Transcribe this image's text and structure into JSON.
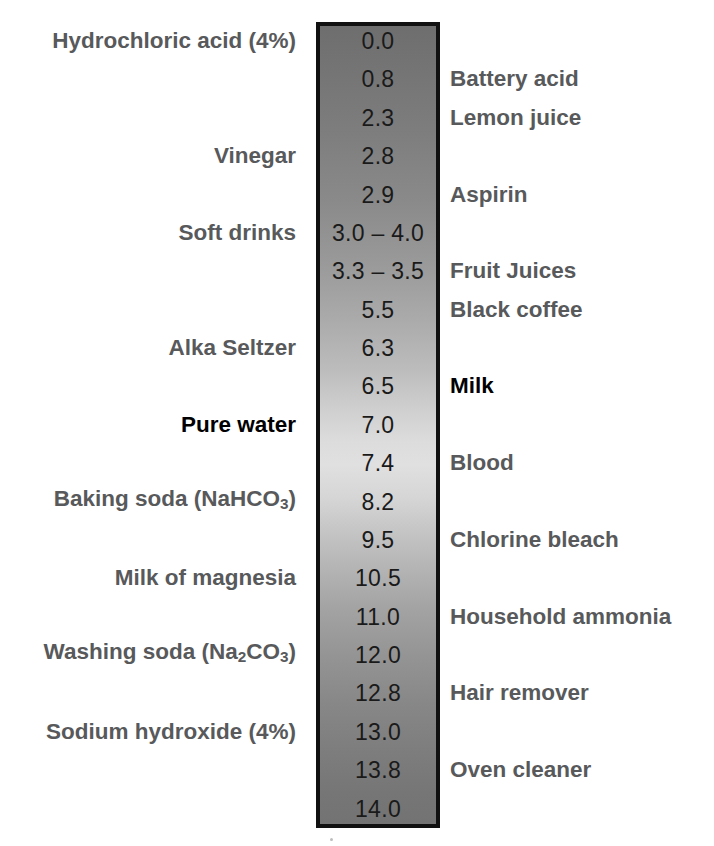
{
  "figure": {
    "column": {
      "top_color": "#6e6e6e",
      "mid_color": "#e0e0e0",
      "bottom_color": "#737373",
      "border_color": "#111111"
    },
    "label_color": "#58595b",
    "emphasis_color": "#000000",
    "value_color": "#1a1a1a"
  },
  "chart_data": {
    "type": "table",
    "xlabel": "",
    "ylabel": "pH",
    "ylim": [
      0.0,
      14.0
    ],
    "columns": [
      "Left substance",
      "pH value",
      "Right substance"
    ],
    "rows": [
      {
        "left": "Hydrochloric acid (4%)",
        "value": "0.0",
        "right": "",
        "ph": 0.0,
        "emphasis": false
      },
      {
        "left": "",
        "value": "0.8",
        "right": "Battery acid",
        "ph": 0.8,
        "emphasis": false
      },
      {
        "left": "",
        "value": "2.3",
        "right": "Lemon juice",
        "ph": 2.3,
        "emphasis": false
      },
      {
        "left": "Vinegar",
        "value": "2.8",
        "right": "",
        "ph": 2.8,
        "emphasis": false
      },
      {
        "left": "",
        "value": "2.9",
        "right": "Aspirin",
        "ph": 2.9,
        "emphasis": false
      },
      {
        "left": "Soft drinks",
        "value": "3.0 – 4.0",
        "right": "",
        "ph": 3.5,
        "emphasis": false
      },
      {
        "left": "",
        "value": "3.3 – 3.5",
        "right": "Fruit Juices",
        "ph": 3.4,
        "emphasis": false
      },
      {
        "left": "",
        "value": "5.5",
        "right": "Black coffee",
        "ph": 5.5,
        "emphasis": false
      },
      {
        "left": "Alka Seltzer",
        "value": "6.3",
        "right": "",
        "ph": 6.3,
        "emphasis": false
      },
      {
        "left": "",
        "value": "6.5",
        "right": "Milk",
        "ph": 6.5,
        "emphasis": true
      },
      {
        "left": "Pure water",
        "value": "7.0",
        "right": "",
        "ph": 7.0,
        "emphasis": true
      },
      {
        "left": "",
        "value": "7.4",
        "right": "Blood",
        "ph": 7.4,
        "emphasis": false
      },
      {
        "left": "Baking soda (NaHCO3)",
        "value": "8.2",
        "right": "",
        "ph": 8.2,
        "emphasis": false,
        "left_html": "Baking soda (NaHCO<sub>3</sub>)"
      },
      {
        "left": "",
        "value": "9.5",
        "right": "Chlorine bleach",
        "ph": 9.5,
        "emphasis": false
      },
      {
        "left": "Milk of magnesia",
        "value": "10.5",
        "right": "",
        "ph": 10.5,
        "emphasis": false
      },
      {
        "left": "",
        "value": "11.0",
        "right": "Household ammonia",
        "ph": 11.0,
        "emphasis": false
      },
      {
        "left": "Washing soda (Na2CO3)",
        "value": "12.0",
        "right": "",
        "ph": 12.0,
        "emphasis": false,
        "left_html": "Washing soda (Na<sub>2</sub>CO<sub>3</sub>)"
      },
      {
        "left": "",
        "value": "12.8",
        "right": "Hair remover",
        "ph": 12.8,
        "emphasis": false
      },
      {
        "left": "Sodium hydroxide (4%)",
        "value": "13.0",
        "right": "",
        "ph": 13.0,
        "emphasis": false
      },
      {
        "left": "",
        "value": "13.8",
        "right": "Oven cleaner",
        "ph": 13.8,
        "emphasis": false
      },
      {
        "left": "",
        "value": "14.0",
        "right": "",
        "ph": 14.0,
        "emphasis": false
      }
    ]
  }
}
